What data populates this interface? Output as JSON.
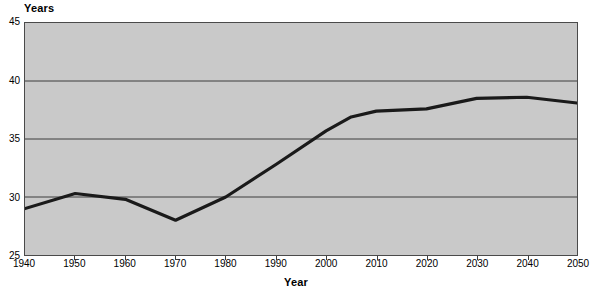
{
  "chart_data": {
    "type": "line",
    "title": "",
    "xlabel": "Year",
    "ylabel": "Years",
    "xlim": [
      1940,
      2050
    ],
    "ylim": [
      25,
      45
    ],
    "grid": true,
    "legend": "none",
    "xticks": [
      "1940",
      "1950",
      "1960",
      "1970",
      "1980",
      "1990",
      "2000",
      "2010",
      "2020",
      "2030",
      "2040",
      "2050"
    ],
    "yticks": [
      "25",
      "30",
      "35",
      "40",
      "45"
    ],
    "x": [
      1940,
      1950,
      1960,
      1970,
      1980,
      1990,
      2000,
      2005,
      2010,
      2020,
      2030,
      2040,
      2050
    ],
    "values": [
      29.0,
      30.3,
      29.8,
      28.0,
      30.0,
      32.8,
      35.7,
      36.9,
      37.4,
      37.6,
      38.5,
      38.6,
      38.1
    ],
    "series": [
      {
        "name": "Years",
        "color": "#1a1a1a",
        "values": [
          29.0,
          30.3,
          29.8,
          28.0,
          30.0,
          32.8,
          35.7,
          36.9,
          37.4,
          37.6,
          38.5,
          38.6,
          38.1
        ]
      }
    ],
    "plot_background": "#c9c9c9",
    "line_color": "#1a1a1a",
    "grid_color": "#3a3a3a"
  }
}
